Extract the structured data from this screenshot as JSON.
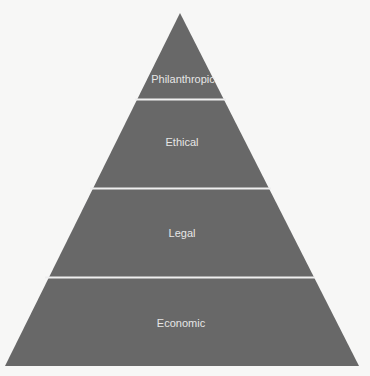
{
  "diagram": {
    "type": "pyramid",
    "fill_color": "#686868",
    "divider_color": "#f2f2f2",
    "background_color": "#f7f7f6",
    "levels_top_to_bottom": [
      {
        "label": "Philanthropic"
      },
      {
        "label": "Ethical"
      },
      {
        "label": "Legal"
      },
      {
        "label": "Economic"
      }
    ]
  }
}
